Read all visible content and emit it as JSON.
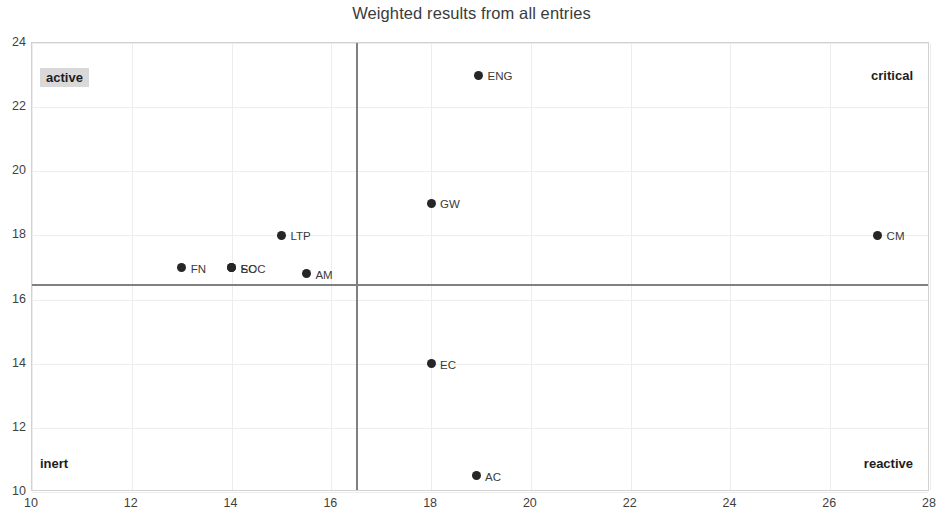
{
  "chart_data": {
    "type": "scatter",
    "title": "Weighted results from all entries",
    "xlabel": "",
    "ylabel": "",
    "xlim": [
      10,
      28
    ],
    "ylim": [
      10,
      24
    ],
    "xticks": [
      10,
      12,
      14,
      16,
      18,
      20,
      22,
      24,
      26,
      28
    ],
    "yticks": [
      10,
      12,
      14,
      16,
      18,
      20,
      22,
      24
    ],
    "grid": true,
    "legend": "none",
    "quadrant_divider_x": 16.5,
    "quadrant_divider_y": 16.5,
    "quadrant_labels": [
      {
        "key": "active",
        "text": "active",
        "corner": "top-left",
        "highlighted": true
      },
      {
        "key": "critical",
        "text": "critical",
        "corner": "top-right",
        "highlighted": false
      },
      {
        "key": "inert",
        "text": "inert",
        "corner": "bottom-left",
        "highlighted": false
      },
      {
        "key": "reactive",
        "text": "reactive",
        "corner": "bottom-right",
        "highlighted": false
      }
    ],
    "points": [
      {
        "label": "ENG",
        "x": 18.95,
        "y": 23.0
      },
      {
        "label": "GW",
        "x": 18.0,
        "y": 19.0
      },
      {
        "label": "CM",
        "x": 26.95,
        "y": 18.0
      },
      {
        "label": "LTP",
        "x": 15.0,
        "y": 18.0
      },
      {
        "label": "FN",
        "x": 13.0,
        "y": 17.0
      },
      {
        "label": "SOC",
        "x": 14.0,
        "y": 17.0
      },
      {
        "label": "EC",
        "x": 14.0,
        "y": 17.0
      },
      {
        "label": "AM",
        "x": 15.5,
        "y": 16.8
      },
      {
        "label": "EC",
        "x": 18.0,
        "y": 14.0
      },
      {
        "label": "AC",
        "x": 18.9,
        "y": 10.5
      }
    ]
  }
}
